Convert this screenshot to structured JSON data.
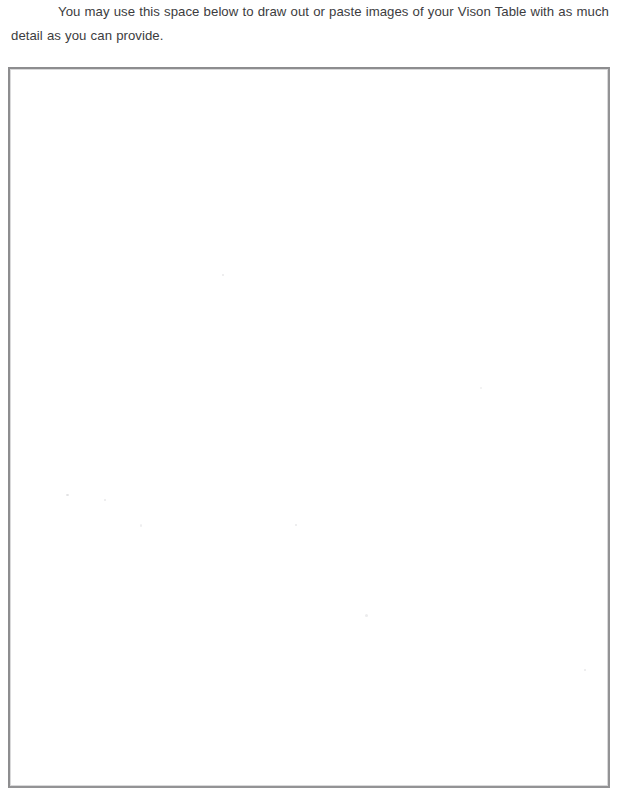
{
  "page": {
    "background_color": "#ffffff",
    "width": 625,
    "height": 800
  },
  "instructions": {
    "text": "You may use this space below to draw out or paste images of your Vison Table with as much detail as you can provide.",
    "text_color": "#3c3c3e"
  },
  "drawing_area": {
    "label": "Vison Table drawing and paste area",
    "content": "",
    "placeholder": "",
    "border_color": "#8d8d8f",
    "fill_color": "#ffffff",
    "is_empty": true
  }
}
